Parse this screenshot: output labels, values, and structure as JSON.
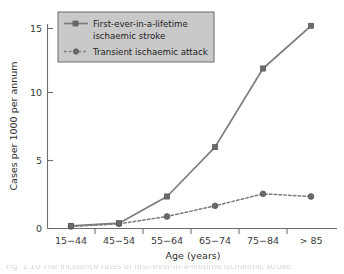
{
  "figure": {
    "background_color": "#ffffff",
    "line_color": "#7d7d7d",
    "legend_fill": "#c9c9c9",
    "legend_border": "#6b6b6b",
    "caption_partial": "Fig. 1.10 The incidence rates of first-ever-in-a-lifetime ischaemic stroke"
  },
  "chart_data": {
    "type": "line",
    "title": "",
    "xlabel": "Age (years)",
    "ylabel": "Cases per 1000 per annum",
    "categories": [
      "15−44",
      "45−54",
      "55−64",
      "65−74",
      "75−84",
      "> 85"
    ],
    "yticks": [
      0,
      5,
      10,
      15
    ],
    "ylim": [
      0,
      16.2
    ],
    "grid": false,
    "legend_position": "upper-left-inside",
    "series": [
      {
        "name": "First-ever-in-a-lifetime ischaemic stroke",
        "label_line1": "First-ever-in-a-lifetime",
        "label_line2": "ischaemic stroke",
        "style": "solid",
        "marker": "square",
        "values": [
          0.2,
          0.4,
          2.4,
          6.1,
          12.0,
          15.2
        ]
      },
      {
        "name": "Transient ischaemic attack",
        "label_line1": "Transient ischaemic attack",
        "label_line2": "",
        "style": "dotted",
        "marker": "circle",
        "values": [
          0.15,
          0.35,
          0.9,
          1.7,
          2.6,
          2.4
        ]
      }
    ]
  }
}
